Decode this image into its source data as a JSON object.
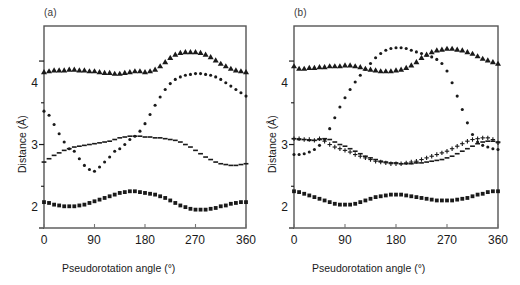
{
  "figure": {
    "background": "#ffffff",
    "ink": "#1a1a1a",
    "panels": [
      {
        "key": "a",
        "label": "(a)"
      },
      {
        "key": "b",
        "label": "(b)"
      }
    ]
  },
  "axes": {
    "xlabel": "Pseudorotation angle (°)",
    "ylabel": "Distance (Å)",
    "xticks": [
      "0",
      "90",
      "180",
      "270",
      "360"
    ],
    "xtick_values": [
      0,
      90,
      180,
      270,
      360
    ],
    "yticks": [
      "2",
      "3",
      "4"
    ],
    "ytick_values": [
      2,
      3,
      4
    ],
    "yminor_values": [
      2.5,
      3.5
    ],
    "xlim": [
      0,
      360
    ],
    "ylim": [
      2.0,
      4.42
    ],
    "grid": "off",
    "legend": "none"
  },
  "chart_data": [
    {
      "type": "scatter",
      "panel": "(a)",
      "title": "(a)",
      "xlabel": "Pseudorotation angle (°)",
      "ylabel": "Distance (Å)",
      "xlim": [
        0,
        360
      ],
      "ylim": [
        2.0,
        4.42
      ],
      "x": [
        0,
        9,
        18,
        27,
        36,
        45,
        54,
        63,
        72,
        81,
        90,
        99,
        108,
        117,
        126,
        135,
        144,
        153,
        162,
        171,
        180,
        189,
        198,
        207,
        216,
        225,
        234,
        243,
        252,
        261,
        270,
        279,
        288,
        297,
        306,
        315,
        324,
        333,
        342,
        351,
        360
      ],
      "series": [
        {
          "name": "triangle-series",
          "marker": "triangle",
          "values": [
            3.87,
            3.88,
            3.89,
            3.89,
            3.89,
            3.9,
            3.9,
            3.89,
            3.89,
            3.88,
            3.88,
            3.87,
            3.86,
            3.86,
            3.85,
            3.85,
            3.86,
            3.87,
            3.88,
            3.88,
            3.87,
            3.88,
            3.9,
            3.94,
            3.99,
            4.04,
            4.08,
            4.1,
            4.11,
            4.11,
            4.11,
            4.1,
            4.08,
            4.05,
            4.01,
            3.97,
            3.94,
            3.91,
            3.89,
            3.88,
            3.87
          ]
        },
        {
          "name": "diamond-series",
          "marker": "diamond",
          "values": [
            3.4,
            3.35,
            3.24,
            3.13,
            3.03,
            2.95,
            2.92,
            2.83,
            2.75,
            2.7,
            2.68,
            2.73,
            2.79,
            2.85,
            2.92,
            2.95,
            3.0,
            3.06,
            3.1,
            3.16,
            3.25,
            3.36,
            3.47,
            3.57,
            3.66,
            3.73,
            3.78,
            3.81,
            3.83,
            3.84,
            3.85,
            3.85,
            3.84,
            3.83,
            3.81,
            3.78,
            3.74,
            3.7,
            3.66,
            3.62,
            3.58
          ]
        },
        {
          "name": "dashed-line-series",
          "marker": "dash",
          "values": [
            2.79,
            2.83,
            2.87,
            2.9,
            2.93,
            2.95,
            2.97,
            2.98,
            2.99,
            3.0,
            3.01,
            3.02,
            3.03,
            3.04,
            3.06,
            3.08,
            3.09,
            3.1,
            3.1,
            3.1,
            3.09,
            3.09,
            3.08,
            3.08,
            3.07,
            3.06,
            3.05,
            3.03,
            3.0,
            2.97,
            2.93,
            2.89,
            2.85,
            2.82,
            2.79,
            2.77,
            2.76,
            2.75,
            2.75,
            2.76,
            2.77
          ]
        },
        {
          "name": "square-series",
          "marker": "square",
          "values": [
            2.31,
            2.3,
            2.28,
            2.27,
            2.26,
            2.26,
            2.26,
            2.27,
            2.28,
            2.3,
            2.32,
            2.34,
            2.36,
            2.38,
            2.4,
            2.42,
            2.43,
            2.44,
            2.44,
            2.43,
            2.42,
            2.41,
            2.4,
            2.38,
            2.36,
            2.33,
            2.3,
            2.27,
            2.25,
            2.23,
            2.22,
            2.22,
            2.22,
            2.23,
            2.24,
            2.26,
            2.27,
            2.29,
            2.3,
            2.31,
            2.31
          ]
        }
      ]
    },
    {
      "type": "scatter",
      "panel": "(b)",
      "title": "(b)",
      "xlabel": "Pseudorotation angle (°)",
      "ylabel": "Distance (Å)",
      "xlim": [
        0,
        360
      ],
      "ylim": [
        2.0,
        4.42
      ],
      "x": [
        0,
        9,
        18,
        27,
        36,
        45,
        54,
        63,
        72,
        81,
        90,
        99,
        108,
        117,
        126,
        135,
        144,
        153,
        162,
        171,
        180,
        189,
        198,
        207,
        216,
        225,
        234,
        243,
        252,
        261,
        270,
        279,
        288,
        297,
        306,
        315,
        324,
        333,
        342,
        351,
        360
      ],
      "series": [
        {
          "name": "triangle-series",
          "marker": "triangle",
          "values": [
            3.94,
            3.91,
            3.91,
            3.92,
            3.92,
            3.93,
            3.93,
            3.94,
            3.94,
            3.94,
            3.95,
            3.95,
            3.94,
            3.93,
            3.91,
            3.9,
            3.89,
            3.88,
            3.88,
            3.88,
            3.89,
            3.9,
            3.92,
            3.95,
            3.99,
            4.04,
            4.08,
            4.11,
            4.13,
            4.14,
            4.15,
            4.15,
            4.14,
            4.13,
            4.11,
            4.09,
            4.06,
            4.03,
            4.01,
            3.99,
            3.97
          ]
        },
        {
          "name": "diamond-series",
          "marker": "diamond",
          "values": [
            2.88,
            2.88,
            2.89,
            2.91,
            2.94,
            2.99,
            3.06,
            3.19,
            3.32,
            3.45,
            3.56,
            3.66,
            3.75,
            3.83,
            3.9,
            3.97,
            4.04,
            4.09,
            4.13,
            4.15,
            4.16,
            4.16,
            4.15,
            4.13,
            4.11,
            4.09,
            4.07,
            4.05,
            4.02,
            3.97,
            3.88,
            3.74,
            3.58,
            3.42,
            3.26,
            3.12,
            3.03,
            2.99,
            2.97,
            2.95,
            2.94
          ]
        },
        {
          "name": "dashed-line-series",
          "marker": "dash",
          "values": [
            3.07,
            3.06,
            3.06,
            3.05,
            3.05,
            3.06,
            3.07,
            3.06,
            3.03,
            3.0,
            2.98,
            2.95,
            2.92,
            2.89,
            2.86,
            2.84,
            2.82,
            2.8,
            2.79,
            2.78,
            2.78,
            2.77,
            2.77,
            2.77,
            2.78,
            2.78,
            2.79,
            2.8,
            2.81,
            2.82,
            2.84,
            2.86,
            2.89,
            2.92,
            2.95,
            2.98,
            3.01,
            3.03,
            3.04,
            3.04,
            3.03
          ]
        },
        {
          "name": "plus-series",
          "marker": "plus",
          "values": [
            3.07,
            3.07,
            3.06,
            3.06,
            3.05,
            3.07,
            3.04,
            3.0,
            2.97,
            2.95,
            2.93,
            2.91,
            2.88,
            2.86,
            2.84,
            2.82,
            2.8,
            2.79,
            2.78,
            2.77,
            2.77,
            2.77,
            2.78,
            2.79,
            2.8,
            2.82,
            2.84,
            2.86,
            2.88,
            2.9,
            2.92,
            2.95,
            2.98,
            3.01,
            3.04,
            3.06,
            3.07,
            3.08,
            3.08,
            3.06,
            3.02
          ]
        },
        {
          "name": "square-series",
          "marker": "square",
          "values": [
            2.44,
            2.43,
            2.41,
            2.39,
            2.37,
            2.35,
            2.33,
            2.31,
            2.29,
            2.28,
            2.28,
            2.28,
            2.29,
            2.31,
            2.33,
            2.35,
            2.37,
            2.38,
            2.39,
            2.4,
            2.4,
            2.4,
            2.39,
            2.38,
            2.37,
            2.36,
            2.35,
            2.34,
            2.33,
            2.33,
            2.33,
            2.33,
            2.34,
            2.35,
            2.36,
            2.38,
            2.4,
            2.41,
            2.43,
            2.44,
            2.44
          ]
        }
      ]
    }
  ]
}
